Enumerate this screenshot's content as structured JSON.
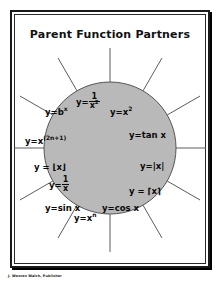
{
  "page": {
    "title": "Parent Function Partners",
    "footer_credit": "J. Weston Walch, Publisher",
    "background_color": "#ffffff",
    "frame_color": "#1a1a1a"
  },
  "diagram": {
    "type": "radial-sunburst",
    "circle": {
      "fill_color": "#b9b9b9",
      "stroke_color": "#555555",
      "center_x": 96,
      "center_y": 100,
      "radius": 66
    },
    "ray_count": 12,
    "ray_color": "#4a4a4a",
    "ray_inner_radius": 66,
    "ray_outer_radius": 104,
    "labels": [
      {
        "id": "exponential",
        "text_plain": "y=b^x",
        "base": "y=b",
        "exponent": "x",
        "kind": "power",
        "x": 31,
        "y": 60
      },
      {
        "id": "reciprocal-squared",
        "text_plain": "y=1/x²",
        "numerator": "1",
        "denominator": "x",
        "den_exponent": "2",
        "kind": "fraction",
        "x": 62,
        "y": 48
      },
      {
        "id": "quadratic",
        "text_plain": "y=x²",
        "base": "y=x",
        "exponent": "2",
        "kind": "power",
        "x": 96,
        "y": 60
      },
      {
        "id": "odd-power",
        "text_plain": "y=x^(2n+1)",
        "base": "y=x",
        "exponent": "(2n+1)",
        "kind": "power",
        "x": 11,
        "y": 89
      },
      {
        "id": "tangent",
        "text_plain": "y=tan x",
        "kind": "plain",
        "x": 115,
        "y": 83
      },
      {
        "id": "floor",
        "text_plain": "y = ⌊x⌋",
        "kind": "plain",
        "x": 20,
        "y": 115
      },
      {
        "id": "absolute-value",
        "text_plain": "y=|x|",
        "kind": "plain",
        "x": 126,
        "y": 114
      },
      {
        "id": "reciprocal",
        "text_plain": "y=1/x",
        "numerator": "1",
        "denominator": "x",
        "kind": "fraction",
        "x": 35,
        "y": 131
      },
      {
        "id": "ceiling",
        "text_plain": "y = ⌈x⌉",
        "kind": "plain",
        "x": 115,
        "y": 139
      },
      {
        "id": "sine",
        "text_plain": "y=sin x",
        "kind": "plain",
        "x": 31,
        "y": 156
      },
      {
        "id": "cosine",
        "text_plain": "y=cos x",
        "kind": "plain",
        "x": 88,
        "y": 156
      },
      {
        "id": "power-n",
        "text_plain": "y=x^n",
        "base": "y=x",
        "exponent": "n",
        "kind": "power",
        "x": 60,
        "y": 168
      }
    ]
  }
}
